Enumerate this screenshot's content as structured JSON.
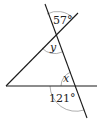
{
  "diagram": {
    "type": "geometry-angles",
    "colors": {
      "line": "#1a1a1a",
      "arc": "#888888",
      "text": "#222222",
      "background": "#ffffff"
    },
    "lines": [
      {
        "name": "steep-transversal",
        "x1": 45,
        "y1": 4,
        "x2": 87,
        "y2": 118
      },
      {
        "name": "diagonal-line",
        "x1": 6,
        "y1": 86,
        "x2": 78,
        "y2": 13
      },
      {
        "name": "horizontal-line",
        "x1": 6,
        "y1": 86,
        "x2": 97,
        "y2": 86
      }
    ],
    "angles": [
      {
        "name": "angle-57",
        "label": "57°",
        "kind": "given"
      },
      {
        "name": "angle-y",
        "label": "y",
        "kind": "unknown"
      },
      {
        "name": "angle-x",
        "label": "x",
        "kind": "unknown"
      },
      {
        "name": "angle-121",
        "label": "121°",
        "kind": "given"
      }
    ]
  }
}
